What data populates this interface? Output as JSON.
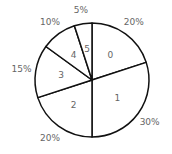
{
  "chart_data": {
    "type": "pie",
    "title": "",
    "categories": [
      "0",
      "1",
      "2",
      "3",
      "4",
      "5"
    ],
    "values": [
      20,
      30,
      20,
      15,
      10,
      5
    ],
    "value_labels": [
      "20%",
      "30%",
      "20%",
      "15%",
      "10%",
      "5%"
    ],
    "start_angle": "12 o'clock",
    "direction": "clockwise",
    "fill_color": "#ffffff",
    "edge_color": "#111111",
    "legend": "none"
  }
}
